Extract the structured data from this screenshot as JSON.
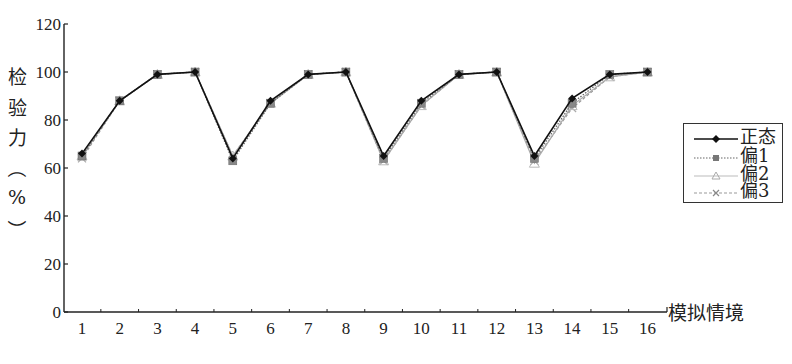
{
  "chart_data": {
    "type": "line",
    "title": "",
    "xlabel": "模拟情境",
    "ylabel": "检验力(%)",
    "ylim": [
      0,
      120
    ],
    "yticks": [
      0,
      20,
      40,
      60,
      80,
      100,
      120
    ],
    "categories": [
      "1",
      "2",
      "3",
      "4",
      "5",
      "6",
      "7",
      "8",
      "9",
      "10",
      "11",
      "12",
      "13",
      "14",
      "15",
      "16"
    ],
    "grid": false,
    "legend_position": "right",
    "series": [
      {
        "name": "正态",
        "color": "#111111",
        "marker": "diamond",
        "style": "solid",
        "values": [
          66,
          88,
          99,
          100,
          64,
          88,
          99,
          100,
          65,
          88,
          99,
          100,
          65,
          89,
          99,
          100
        ]
      },
      {
        "name": "偏1",
        "color": "#666666",
        "marker": "square",
        "style": "dotted",
        "values": [
          65,
          88,
          99,
          100,
          63,
          87,
          99,
          100,
          64,
          87,
          99,
          100,
          64,
          87,
          99,
          100
        ]
      },
      {
        "name": "偏2",
        "color": "#aaaaaa",
        "marker": "triangle",
        "style": "solid",
        "values": [
          65,
          88,
          99,
          100,
          65,
          87,
          99,
          100,
          63,
          86,
          99,
          100,
          62,
          86,
          98,
          100
        ]
      },
      {
        "name": "偏3",
        "color": "#999999",
        "marker": "x",
        "style": "dashed",
        "values": [
          64,
          88,
          99,
          100,
          65,
          87,
          99,
          100,
          63,
          86,
          99,
          100,
          63,
          85,
          98,
          100
        ]
      }
    ]
  },
  "axis": {
    "y_title_chars": [
      "检",
      "验",
      "力",
      "（",
      "%",
      "）"
    ],
    "x_title": "模拟情境"
  },
  "legend": {
    "items": [
      "正态",
      "偏1",
      "偏2",
      "偏3"
    ]
  }
}
